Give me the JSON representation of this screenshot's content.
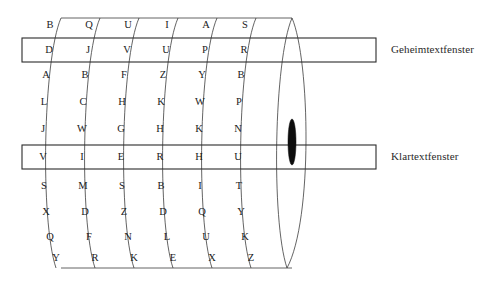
{
  "figure": {
    "type": "cipher-cylinder-diagram",
    "disc_count": 7,
    "lettered_disc_count": 6,
    "rows_per_disc": 10,
    "stroke_color": "#3c3c3c",
    "marker_color": "#0d0d0d"
  },
  "labels": {
    "ciphertext_window": "Geheimtextfenster",
    "plaintext_window": "Klartextfenster"
  },
  "windows": {
    "ciphertext": {
      "label": "Geheimtextfenster",
      "row_index": 1,
      "letters": [
        "D",
        "J",
        "V",
        "U",
        "P",
        "R"
      ],
      "word": "DJVUPR"
    },
    "plaintext": {
      "label": "Klartextfenster",
      "row_index": 5,
      "letters": [
        "V",
        "I",
        "E",
        "R",
        "H",
        "U"
      ],
      "word": "VIERHU"
    }
  },
  "discs": [
    {
      "index": 1,
      "letters": [
        "B",
        "D",
        "A",
        "L",
        "J",
        "V",
        "S",
        "X",
        "Q",
        "Y"
      ]
    },
    {
      "index": 2,
      "letters": [
        "Q",
        "J",
        "B",
        "C",
        "W",
        "I",
        "M",
        "D",
        "F",
        "R"
      ]
    },
    {
      "index": 3,
      "letters": [
        "U",
        "V",
        "F",
        "H",
        "G",
        "E",
        "S",
        "Z",
        "N",
        "K"
      ]
    },
    {
      "index": 4,
      "letters": [
        "I",
        "U",
        "Z",
        "K",
        "H",
        "R",
        "B",
        "D",
        "L",
        "E"
      ]
    },
    {
      "index": 5,
      "letters": [
        "A",
        "P",
        "Y",
        "W",
        "K",
        "H",
        "I",
        "Q",
        "U",
        "X"
      ]
    },
    {
      "index": 6,
      "letters": [
        "S",
        "R",
        "B",
        "P",
        "N",
        "U",
        "T",
        "Y",
        "K",
        "Z"
      ]
    },
    {
      "index": 7,
      "letters": [
        "",
        "",
        "",
        "",
        "",
        "",
        "",
        "",
        "",
        ""
      ]
    }
  ],
  "rows": [
    {
      "index": 0,
      "letters": [
        "B",
        "Q",
        "U",
        "I",
        "A",
        "S"
      ]
    },
    {
      "index": 1,
      "letters": [
        "D",
        "J",
        "V",
        "U",
        "P",
        "R"
      ]
    },
    {
      "index": 2,
      "letters": [
        "A",
        "B",
        "F",
        "Z",
        "Y",
        "B"
      ]
    },
    {
      "index": 3,
      "letters": [
        "L",
        "C",
        "H",
        "K",
        "W",
        "P"
      ]
    },
    {
      "index": 4,
      "letters": [
        "J",
        "W",
        "G",
        "H",
        "K",
        "N"
      ]
    },
    {
      "index": 5,
      "letters": [
        "V",
        "I",
        "E",
        "R",
        "H",
        "U"
      ]
    },
    {
      "index": 6,
      "letters": [
        "S",
        "M",
        "S",
        "B",
        "I",
        "T"
      ]
    },
    {
      "index": 7,
      "letters": [
        "X",
        "D",
        "Z",
        "D",
        "Q",
        "Y"
      ]
    },
    {
      "index": 8,
      "letters": [
        "Q",
        "F",
        "N",
        "L",
        "U",
        "K"
      ]
    },
    {
      "index": 9,
      "letters": [
        "Y",
        "R",
        "K",
        "E",
        "X",
        "Z"
      ]
    }
  ],
  "marker": {
    "name": "index-marker",
    "disc_index": 7,
    "color": "#0d0d0d"
  }
}
